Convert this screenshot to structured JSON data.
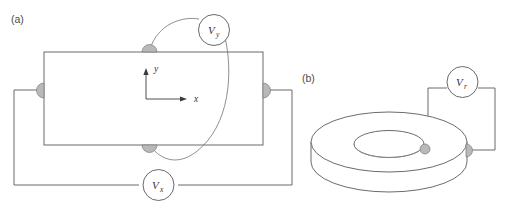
{
  "figure": {
    "background_color": "#ffffff",
    "line_color": "#59595b",
    "sample_line_color": "#5a5a5c",
    "contact_fill": "#b9b9b9",
    "contact_stroke": "#7a7a7a",
    "text_color": "#3a3a3a"
  },
  "panels": [
    {
      "id": "panel-a",
      "label": "(a)",
      "geometry_name": "hall-bar",
      "axes": {
        "x_label": "x",
        "y_label": "y"
      },
      "meters": [
        {
          "id": "meter-vy",
          "symbol": "V",
          "subscript": "y",
          "full_label": "Vy"
        },
        {
          "id": "meter-vx",
          "symbol": "V",
          "subscript": "x",
          "full_label": "Vx"
        }
      ],
      "contacts": [
        {
          "id": "contact-top",
          "position": "top-edge"
        },
        {
          "id": "contact-bottom",
          "position": "bottom-edge"
        },
        {
          "id": "contact-left",
          "position": "left-edge"
        },
        {
          "id": "contact-right",
          "position": "right-edge"
        }
      ]
    },
    {
      "id": "panel-b",
      "label": "(b)",
      "geometry_name": "corbino-disk",
      "meters": [
        {
          "id": "meter-vr",
          "symbol": "V",
          "subscript": "r",
          "full_label": "Vr"
        }
      ],
      "contacts": [
        {
          "id": "contact-inner",
          "position": "inner-rim"
        },
        {
          "id": "contact-outer",
          "position": "outer-rim"
        }
      ]
    }
  ]
}
